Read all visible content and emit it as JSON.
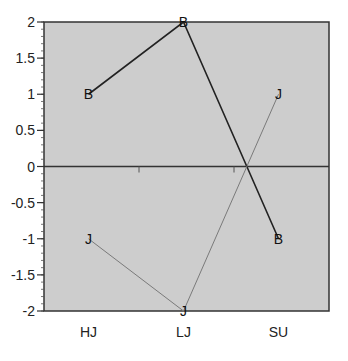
{
  "chart_data": {
    "type": "line",
    "title": "",
    "xlabel": "",
    "ylabel": "",
    "categories": [
      "HJ",
      "LJ",
      "SU"
    ],
    "series": [
      {
        "name": "B",
        "marker": "B",
        "color": "#222222",
        "line_width": 1.6,
        "values": [
          1,
          2,
          -1
        ]
      },
      {
        "name": "J",
        "marker": "J",
        "color": "#7a7a7a",
        "line_width": 1.0,
        "values": [
          -1,
          -2,
          1
        ]
      }
    ],
    "ylim": [
      -2,
      2
    ],
    "yticks": [
      2,
      1.5,
      1,
      0.5,
      0,
      -0.5,
      -1,
      -1.5,
      -2
    ],
    "ytick_labels": [
      "2",
      "1.5",
      "1",
      "0.5",
      "0",
      "-0.5",
      "-1",
      "-1.5",
      "-2"
    ],
    "minor_ytick_step": 0.1,
    "zero_line": true,
    "grid": false,
    "legend": "none",
    "plot_background": "#cdcdcd"
  }
}
